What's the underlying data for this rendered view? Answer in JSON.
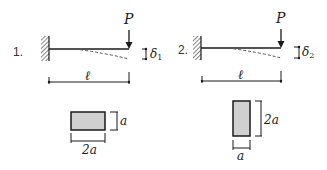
{
  "diagrams": [
    {
      "number": "1.",
      "load_label": "P",
      "deflection_label": "δ",
      "deflection_sub": "1",
      "length_label": "ℓ",
      "section": {
        "width_label": "2a",
        "height_label": "a",
        "orientation": "horizontal"
      }
    },
    {
      "number": "2.",
      "load_label": "P",
      "deflection_label": "δ",
      "deflection_sub": "2",
      "length_label": "ℓ",
      "section": {
        "width_label": "a",
        "height_label": "2a",
        "orientation": "vertical"
      }
    }
  ],
  "colors": {
    "line": "#1a1a1a",
    "section_fill": "#d0d0d0",
    "hatch": "#333333"
  }
}
